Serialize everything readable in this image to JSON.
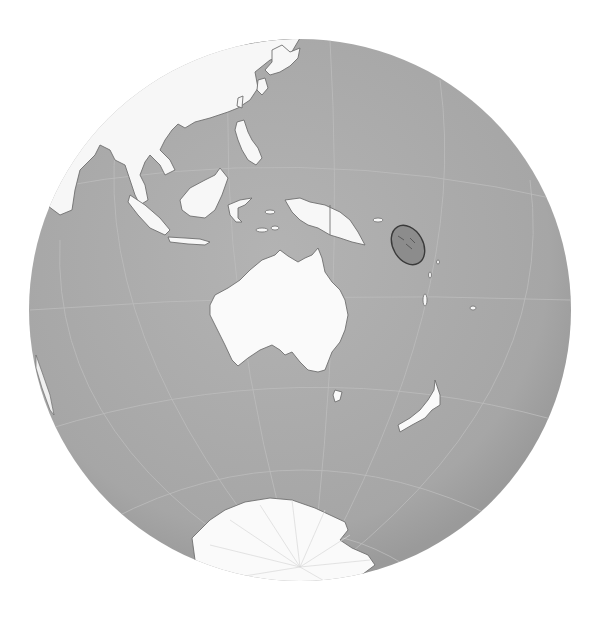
{
  "map": {
    "projection": "orthographic",
    "highlighted_country": "Solomon Islands",
    "colors": {
      "background": "#ffffff",
      "ocean": "#a9a9a9",
      "land": "#fafafa",
      "border": "#6e6e6e",
      "graticule": "#bdbdbd",
      "highlight_fill": "#8a8a8a",
      "highlight_stroke": "#3c3c3c"
    },
    "visible_regions": [
      "East Asia",
      "Southeast Asia",
      "Indonesia",
      "Papua New Guinea",
      "Australia",
      "New Zealand",
      "Antarctica",
      "Solomon Islands"
    ]
  }
}
